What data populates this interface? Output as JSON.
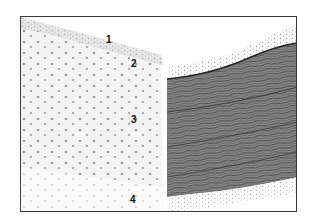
{
  "figure": {
    "type": "histology-micrograph",
    "panels": [
      {
        "id": "left",
        "description": "lightly stained tissue section with scattered nuclei"
      },
      {
        "id": "right",
        "description": "densely stained fibrous tissue section"
      }
    ],
    "labels": [
      {
        "text": "1",
        "x": 85,
        "y": 18
      },
      {
        "text": "2",
        "x": 110,
        "y": 42
      },
      {
        "text": "3",
        "x": 110,
        "y": 98
      },
      {
        "text": "4",
        "x": 109,
        "y": 178
      }
    ],
    "colors": {
      "frame": "#3a3a3a",
      "background": "#ffffff",
      "nucleus": "#6b6b6b",
      "fiber_dark": "#3c3c3c",
      "fiber_mid": "#7a7a7a"
    }
  }
}
